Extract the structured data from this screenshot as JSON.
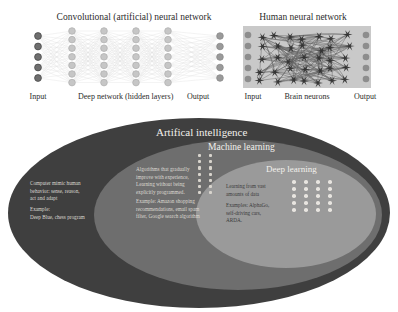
{
  "diagrams": {
    "cnn": {
      "title": "Convolutional (artificial) neural network",
      "input_label": "Input",
      "middle_label": "Deep network\n(hidden layers)",
      "output_label": "Output",
      "input_nodes": 5,
      "hidden_layers": 4,
      "hidden_nodes_per_layer": 7,
      "output_nodes": 5,
      "input_node_color": "#6f6f6f",
      "hidden_node_color": "#c6c6c6",
      "output_node_color": "#9a9a9a"
    },
    "hnn": {
      "title": "Human neural network",
      "input_label": "Input",
      "middle_label": "Brain neurons",
      "output_label": "Output",
      "input_nodes": 5,
      "output_nodes": 5,
      "node_color": "#8d8d8d",
      "background_color": "#c9c9c9",
      "neuron_color": "#2f2f2f"
    }
  },
  "ai_venn": {
    "outer": {
      "label": "Artifical intelligence",
      "color": "#3f3f3f",
      "description": "Computer mimic human\nbehavior: sense, reason,\nact and adapt",
      "example": "Example:\nDeep Blue, chess program"
    },
    "middle": {
      "label": "Machine learning",
      "color": "#6e6e6e",
      "description": "Algorithms that gradually\nimprove with experience,\nLearning without being\nexplicitly programmed.",
      "example": "Example: Amazon shopping\nrecommendations, email spam\nfilter, Google search algorithm"
    },
    "inner": {
      "label": "Deep learning",
      "color": "#9a9a9a",
      "description": "Learning from vast\namounts of data",
      "example": "Examples: AlphaGo,\nself-driving cars,\nARDA."
    },
    "ml_dot_grid": {
      "columns": 2,
      "rows": 7
    },
    "dl_dot_grid": {
      "columns": 4,
      "rows": 5
    }
  }
}
